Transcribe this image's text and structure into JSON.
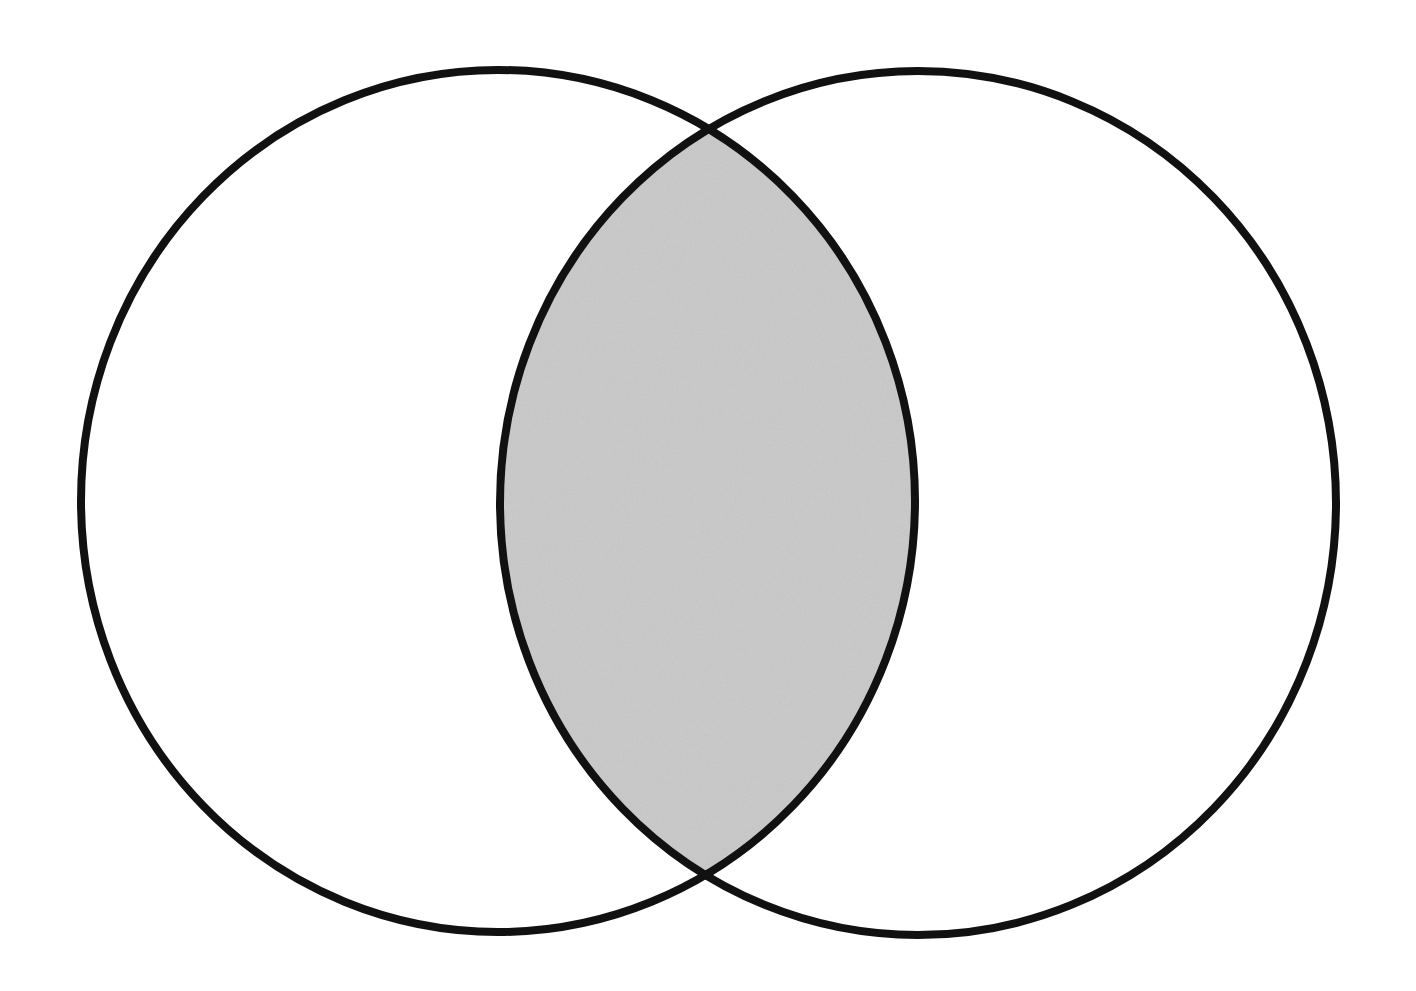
{
  "diagram": {
    "type": "venn",
    "sets": [
      {
        "id": "A",
        "label": ""
      },
      {
        "id": "B",
        "label": ""
      }
    ],
    "shaded_region": "intersection",
    "colors": {
      "background": "#ffffff",
      "outline": "#111111",
      "shade": "#c9c9c9"
    }
  }
}
